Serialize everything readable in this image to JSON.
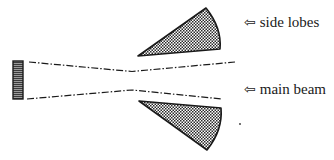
{
  "diagram": {
    "type": "antenna-radiation-pattern",
    "colors": {
      "background": "#ffffff",
      "stroke": "#1a1a1a",
      "hatch": "#2a2a2a",
      "aperture_fill": "#5a5a5a"
    },
    "labels": {
      "side_lobes": "side lobes",
      "main_beam": "main beam",
      "arrow_glyph": "⇦"
    },
    "elements": {
      "aperture": "antenna-aperture",
      "main_beam": "main-beam-envelope",
      "side_lobes": [
        "upper-side-lobe",
        "lower-side-lobe"
      ]
    }
  }
}
